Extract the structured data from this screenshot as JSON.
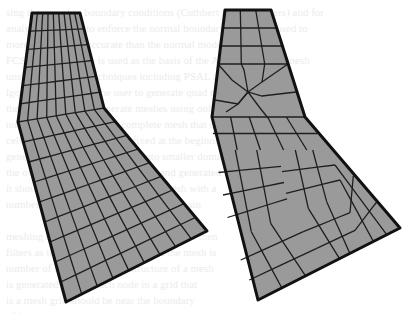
{
  "figure": {
    "panels": [
      {
        "name": "structured-mesh",
        "description": "Mapped quadrilateral mesh on bent tapered domain",
        "fill_color": "#9a9a9a",
        "line_color": "#1e1e1e",
        "divisions_across": 9,
        "divisions_upper": 6,
        "divisions_lower": 9
      },
      {
        "name": "unstructured-mesh",
        "description": "Paved (unstructured) quadrilateral mesh on same domain",
        "fill_color": "#9a9a9a",
        "line_color": "#1e1e1e"
      }
    ],
    "bleed_through_text": "sing the use of in boundary conditions (Cuthbert and coworkers) and for\nanalytical models to enforce the normal boundary conditions used to\nmore flexible and accurate than the normal mode.\nFCS Mesh the mesh is used as the basis of the ACMI and FEM mesh\nunstructured mesh techniques including PSAL and quad mesh\nlgorithms that allow the user to generate quad meshes for\nthese tools can now generate meshes using only a small\nnumber of quads with the complete mesh that contains\ncells. The number of cells is fixed at the beginning of the\ngeneration time; mesh domain into smaller domains and\nthe overall mesh is then structured and generated\nit should be structured grid of quad mesh with a\nnumber of refinement regions of the domain\n\nmeshing can be further refined, the mesh is then\nfilters as in the previous section and the mesh is\nnumber of nodes within the structure of a mesh\nis generated having each node in a grid that\nis a mesh grid should be near the boundary\nof it to."
  }
}
